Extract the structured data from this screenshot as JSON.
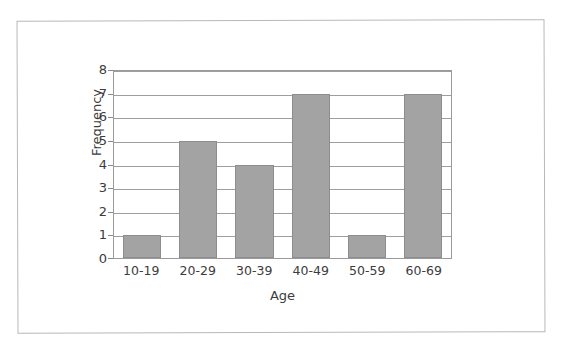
{
  "chart_data": {
    "type": "bar",
    "title": "",
    "categories": [
      "10-19",
      "20-29",
      "30-39",
      "40-49",
      "50-59",
      "60-69"
    ],
    "values": [
      1,
      5,
      4,
      7,
      1,
      7
    ],
    "xlabel": "Age",
    "ylabel": "Frequency",
    "ylim": [
      0,
      8
    ],
    "ytick_labels": [
      "8",
      "7",
      "6",
      "5",
      "4",
      "3",
      "2",
      "1",
      "0"
    ],
    "ytick_values": [
      8,
      7,
      6,
      5,
      4,
      3,
      2,
      1,
      0
    ],
    "ytick_step": 1,
    "grid": "horizontal",
    "legend": null,
    "legend_position": "none",
    "series": [
      {
        "name": "Frequency",
        "values": [
          1,
          5,
          4,
          7,
          1,
          7
        ]
      }
    ],
    "colors": {
      "bar_fill": "#a3a3a3",
      "bar_border": "#8d8d8d",
      "gridline": "#9e9e9e",
      "axis": "#9a9a9a",
      "text": "#3c3c3c",
      "page_border": "#b8b8b8",
      "background": "#ffffff"
    }
  }
}
